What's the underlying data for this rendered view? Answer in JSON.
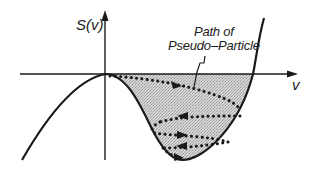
{
  "diagram": {
    "type": "potential-curve",
    "y_axis_label": "S(v)",
    "x_axis_label": "v",
    "annotation": {
      "line1": "Path of",
      "line2": "Pseudo–Particle"
    },
    "colors": {
      "stroke": "#1a1a1a",
      "fill": "#c8c8c8",
      "background": "#ffffff"
    },
    "path_arrows": [
      {
        "direction": "right"
      },
      {
        "direction": "left"
      },
      {
        "direction": "right"
      },
      {
        "direction": "left"
      },
      {
        "direction": "right"
      }
    ]
  }
}
